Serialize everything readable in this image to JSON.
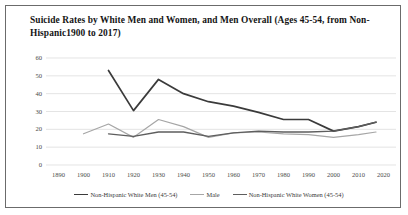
{
  "chart_data": {
    "type": "line",
    "title": "Suicide Rates by White Men and Women, and Men Overall (Ages 45-54, from Non-Hispanic1900 to 2017)",
    "xlabel": "",
    "ylabel": "",
    "xlim": [
      1885,
      2025
    ],
    "ylim": [
      0,
      60
    ],
    "grid": true,
    "grid_axis": "y",
    "legend_position": "bottom",
    "x_ticks": [
      "1890",
      "1900",
      "1910",
      "1920",
      "1930",
      "1940",
      "1950",
      "1960",
      "1970",
      "1980",
      "1990",
      "2000",
      "2010",
      "2020"
    ],
    "y_ticks": [
      "0",
      "10",
      "20",
      "30",
      "40",
      "50",
      "60"
    ],
    "series": [
      {
        "name": "Non-Hispanic White Men (45-54)",
        "color": "#3b3b3b",
        "width": 1.7,
        "x": [
          1910,
          1920,
          1930,
          1940,
          1950,
          1960,
          1970,
          1980,
          1990,
          2000,
          2010,
          2017
        ],
        "values": [
          53,
          30.5,
          48,
          40,
          35.5,
          33,
          29.5,
          25.5,
          25.5,
          19,
          21.5,
          24
        ]
      },
      {
        "name": "Male",
        "color": "#a6a6a6",
        "width": 1.2,
        "x": [
          1900,
          1910,
          1920,
          1930,
          1940,
          1950,
          1960,
          1970,
          1980,
          1990,
          2000,
          2010,
          2017
        ],
        "values": [
          17.5,
          23,
          15.5,
          25.5,
          21.5,
          15.5,
          18,
          18.5,
          17.5,
          17,
          15.5,
          17,
          18.5
        ]
      },
      {
        "name": "Non-Hispanic White Women (45-54)",
        "color": "#5e5e5e",
        "width": 1.3,
        "x": [
          1910,
          1920,
          1930,
          1940,
          1950,
          1960,
          1970,
          1980,
          1990,
          2000,
          2010,
          2017
        ],
        "values": [
          17.5,
          16,
          18.5,
          18.5,
          16,
          18,
          19,
          18.5,
          18.5,
          19,
          21.5,
          24
        ]
      }
    ]
  },
  "legend": {
    "items": [
      {
        "label": "Non-Hispanic White Men (45-54)",
        "color": "#3b3b3b",
        "width": 1.8
      },
      {
        "label": "Male",
        "color": "#a6a6a6",
        "width": 1.3
      },
      {
        "label": "Non-Hispanic White Women (45-54)",
        "color": "#5e5e5e",
        "width": 1.5
      }
    ]
  }
}
